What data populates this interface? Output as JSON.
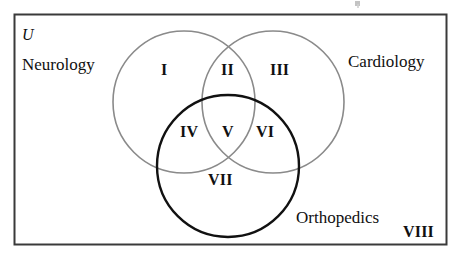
{
  "figure": {
    "type": "venn-diagram",
    "universe_symbol": "U",
    "set_count": 3,
    "sets": [
      {
        "id": "neurology",
        "label": "Neurology",
        "color": "#8a8a8a",
        "position": "left"
      },
      {
        "id": "cardiology",
        "label": "Cardiology",
        "color": "#8a8a8a",
        "position": "right"
      },
      {
        "id": "orthopedics",
        "label": "Orthopedics",
        "color": "#111111",
        "position": "bottom"
      }
    ],
    "regions": [
      {
        "id": "region-1",
        "label": "I",
        "belongs_to": [
          "neurology"
        ]
      },
      {
        "id": "region-2",
        "label": "II",
        "belongs_to": [
          "neurology",
          "cardiology"
        ]
      },
      {
        "id": "region-3",
        "label": "III",
        "belongs_to": [
          "cardiology"
        ]
      },
      {
        "id": "region-4",
        "label": "IV",
        "belongs_to": [
          "neurology",
          "orthopedics"
        ]
      },
      {
        "id": "region-5",
        "label": "V",
        "belongs_to": [
          "neurology",
          "cardiology",
          "orthopedics"
        ]
      },
      {
        "id": "region-6",
        "label": "VI",
        "belongs_to": [
          "cardiology",
          "orthopedics"
        ]
      },
      {
        "id": "region-7",
        "label": "VII",
        "belongs_to": [
          "orthopedics"
        ]
      },
      {
        "id": "region-8",
        "label": "VIII",
        "belongs_to": []
      }
    ],
    "colors": {
      "circle_gray": "#8a8a8a",
      "circle_black": "#111111",
      "frame": "#3a3a3a",
      "text": "#101010",
      "background": "#ffffff"
    }
  }
}
